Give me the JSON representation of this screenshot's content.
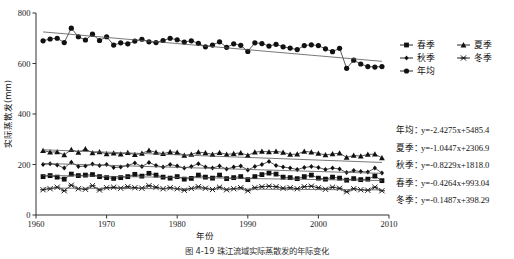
{
  "figure": {
    "caption": "图 4-19  珠江流域实际蒸散发的年际变化"
  },
  "chart_data": {
    "type": "line",
    "title": "",
    "xlabel": "年份",
    "ylabel": "实际蒸散发(mm)",
    "xlim": [
      1960,
      2010
    ],
    "ylim": [
      0,
      800
    ],
    "xticks": [
      1960,
      1970,
      1980,
      1990,
      2000,
      2010
    ],
    "yticks": [
      0,
      200,
      400,
      600,
      800
    ],
    "grid": false,
    "legend_position": "right-top",
    "x": [
      1961,
      1962,
      1963,
      1964,
      1965,
      1966,
      1967,
      1968,
      1969,
      1970,
      1971,
      1972,
      1973,
      1974,
      1975,
      1976,
      1977,
      1978,
      1979,
      1980,
      1981,
      1982,
      1983,
      1984,
      1985,
      1986,
      1987,
      1988,
      1989,
      1990,
      1991,
      1992,
      1993,
      1994,
      1995,
      1996,
      1997,
      1998,
      1999,
      2000,
      2001,
      2002,
      2003,
      2004,
      2005,
      2006,
      2007,
      2008,
      2009
    ],
    "series": [
      {
        "name": "年均",
        "marker": "circle",
        "values": [
          690,
          697,
          700,
          683,
          740,
          706,
          693,
          716,
          691,
          706,
          673,
          682,
          678,
          689,
          696,
          686,
          683,
          691,
          700,
          694,
          685,
          690,
          680,
          666,
          673,
          686,
          664,
          678,
          672,
          648,
          682,
          679,
          669,
          676,
          666,
          661,
          655,
          671,
          674,
          671,
          658,
          647,
          660,
          581,
          613,
          598,
          588,
          586,
          588
        ]
      },
      {
        "name": "夏季",
        "marker": "triangle",
        "values": [
          255,
          249,
          250,
          238,
          259,
          248,
          262,
          246,
          250,
          242,
          245,
          241,
          247,
          239,
          244,
          256,
          248,
          243,
          250,
          248,
          236,
          240,
          249,
          246,
          240,
          247,
          240,
          243,
          246,
          236,
          249,
          252,
          250,
          252,
          248,
          240,
          241,
          252,
          249,
          244,
          238,
          242,
          245,
          228,
          236,
          233,
          240,
          241,
          226
        ]
      },
      {
        "name": "秋季",
        "marker": "diamond",
        "values": [
          200,
          203,
          198,
          186,
          209,
          192,
          194,
          202,
          196,
          200,
          188,
          190,
          196,
          206,
          192,
          208,
          196,
          190,
          200,
          194,
          186,
          192,
          203,
          190,
          186,
          194,
          182,
          190,
          194,
          178,
          192,
          200,
          212,
          196,
          190,
          186,
          180,
          188,
          192,
          188,
          180,
          186,
          182,
          168,
          176,
          172,
          170,
          186,
          166
        ]
      },
      {
        "name": "春季",
        "marker": "square",
        "values": [
          152,
          156,
          150,
          142,
          162,
          156,
          158,
          160,
          152,
          148,
          145,
          148,
          152,
          161,
          154,
          165,
          158,
          150,
          146,
          152,
          142,
          145,
          158,
          150,
          146,
          158,
          144,
          148,
          152,
          140,
          152,
          160,
          166,
          162,
          150,
          148,
          144,
          152,
          158,
          146,
          142,
          150,
          146,
          138,
          144,
          140,
          142,
          154,
          136
        ]
      },
      {
        "name": "冬季",
        "marker": "x",
        "values": [
          100,
          104,
          110,
          96,
          118,
          104,
          102,
          116,
          99,
          108,
          110,
          106,
          112,
          108,
          106,
          116,
          110,
          104,
          108,
          104,
          98,
          105,
          112,
          106,
          101,
          110,
          100,
          104,
          108,
          96,
          108,
          112,
          114,
          112,
          106,
          108,
          104,
          112,
          114,
          108,
          102,
          110,
          106,
          92,
          104,
          100,
          98,
          110,
          96
        ]
      }
    ],
    "trend_annual": {
      "slope": -2.4275,
      "intercept": 5485.4
    },
    "trend_xia": {
      "slope": -1.0447,
      "intercept": 2306.9
    },
    "trend_qiu": {
      "slope": -0.8229,
      "intercept": 1818.0
    },
    "trend_chun": {
      "slope": -0.4264,
      "intercept": 993.04
    },
    "trend_dong": {
      "slope": -0.1487,
      "intercept": 398.29
    },
    "legend": [
      {
        "label": "春季",
        "marker": "square"
      },
      {
        "label": "夏季",
        "marker": "triangle"
      },
      {
        "label": "秋季",
        "marker": "diamond"
      },
      {
        "label": "冬季",
        "marker": "x"
      },
      {
        "label": "年均",
        "marker": "circle"
      }
    ],
    "equations": [
      {
        "label": "年均",
        "sep": "：",
        "text": "y=-2.4275x+5485.4"
      },
      {
        "label": "夏季",
        "sep": "：",
        "text": "y=-1.0447x+2306.9"
      },
      {
        "label": "秋季",
        "sep": "：",
        "text": "y=-0.8229x+1818.0"
      },
      {
        "label": "春季",
        "sep": "：",
        "text": "y=-0.4264x+993.04"
      },
      {
        "label": "冬季",
        "sep": "：",
        "text": "y=-0.1487x+398.29"
      }
    ]
  }
}
